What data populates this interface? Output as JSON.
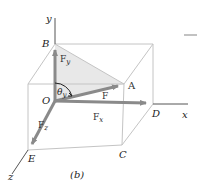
{
  "figure": {
    "caption": "(b)",
    "colors": {
      "box_edge": "#c4c4c4",
      "axis": "#555555",
      "vector": "#8a8a8a",
      "shade": "#e6e6e6"
    },
    "axes": {
      "x": "x",
      "y": "y",
      "z": "z"
    },
    "points": {
      "O": "O",
      "A": "A",
      "B": "B",
      "C": "C",
      "D": "D",
      "E": "E"
    },
    "vectors": {
      "F": "F",
      "Fx_main": "F",
      "Fx_sub": "x",
      "Fy_main": "F",
      "Fy_sub": "y",
      "Fz_main": "F",
      "Fz_sub": "z"
    },
    "angle": {
      "main": "θ",
      "sub": "y"
    }
  }
}
